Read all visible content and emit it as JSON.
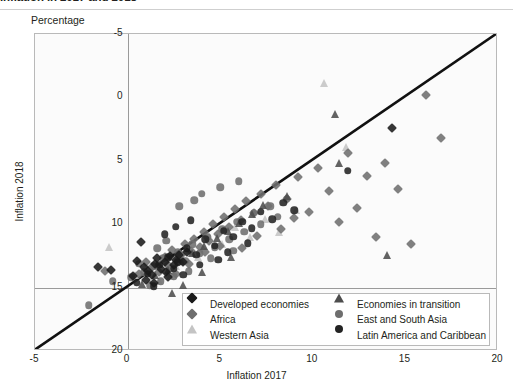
{
  "title": "Inflation in 2017 and 2018",
  "unit_label": "Percentage",
  "axes": {
    "xlabel": "Inflation 2017",
    "ylabel": "Inflation 2018",
    "xticks": [
      "-5",
      "0",
      "5",
      "10",
      "15",
      "20"
    ],
    "yticks": [
      "20",
      "15",
      "10",
      "5",
      "0",
      "-5"
    ]
  },
  "legend": {
    "column1": [
      {
        "label": "Developed economies",
        "marker": "diamond",
        "color": "#1a1a1a"
      },
      {
        "label": "Africa",
        "marker": "diamond",
        "color": "#6e6e6e"
      },
      {
        "label": "Western Asia",
        "marker": "triangle",
        "color": "#c4c4c4"
      }
    ],
    "column2": [
      {
        "label": "Economies in transition",
        "marker": "triangle",
        "color": "#4d4d4d"
      },
      {
        "label": "East and South Asia",
        "marker": "circle",
        "color": "#6e6e6e"
      },
      {
        "label": "Latin America and Caribbean",
        "marker": "circle",
        "color": "#232323"
      }
    ]
  },
  "chart_data": {
    "type": "scatter",
    "title": "Inflation in 2017 and 2018",
    "xlabel": "Inflation 2017",
    "ylabel": "Inflation 2018",
    "unit": "Percentage",
    "xlim": [
      -5,
      20
    ],
    "ylim": [
      -5,
      20
    ],
    "xticks": [
      -5,
      0,
      5,
      10,
      15,
      20
    ],
    "yticks": [
      -5,
      0,
      5,
      10,
      15,
      20
    ],
    "grid": false,
    "legend_position": "bottom-center-inside",
    "reference_line": {
      "type": "identity",
      "from": [
        -5,
        -5
      ],
      "to": [
        20,
        20
      ],
      "color": "#111111",
      "width": 2.6
    },
    "series": [
      {
        "name": "Developed economies",
        "marker": "diamond",
        "color": "#1a1a1a",
        "size": 7,
        "points": [
          [
            -1.6,
            1.6
          ],
          [
            -0.9,
            1.4
          ],
          [
            0.7,
            3.6
          ],
          [
            0.5,
            2.1
          ],
          [
            0.9,
            1.6
          ],
          [
            1.1,
            1.3
          ],
          [
            1.3,
            1.0
          ],
          [
            1.5,
            1.9
          ],
          [
            1.6,
            2.3
          ],
          [
            1.8,
            1.5
          ],
          [
            2.0,
            2.0
          ],
          [
            2.1,
            1.2
          ],
          [
            2.3,
            2.5
          ],
          [
            2.5,
            1.8
          ],
          [
            2.6,
            2.2
          ],
          [
            2.8,
            2.6
          ],
          [
            3.0,
            2.0
          ],
          [
            3.2,
            2.8
          ],
          [
            1.0,
            0.6
          ],
          [
            1.4,
            0.4
          ],
          [
            0.3,
            0.9
          ],
          [
            2.2,
            0.8
          ],
          [
            14.3,
            12.6
          ]
        ]
      },
      {
        "name": "Africa",
        "marker": "diamond",
        "color": "#6e6e6e",
        "size": 7,
        "points": [
          [
            -1.2,
            1.3
          ],
          [
            0.6,
            1.1
          ],
          [
            1.0,
            2.0
          ],
          [
            1.3,
            1.6
          ],
          [
            1.7,
            1.2
          ],
          [
            2.0,
            2.4
          ],
          [
            2.2,
            1.8
          ],
          [
            2.4,
            3.0
          ],
          [
            2.7,
            2.2
          ],
          [
            2.9,
            2.6
          ],
          [
            3.1,
            3.4
          ],
          [
            3.4,
            2.9
          ],
          [
            3.6,
            3.8
          ],
          [
            3.9,
            3.2
          ],
          [
            4.1,
            4.4
          ],
          [
            4.4,
            3.7
          ],
          [
            4.6,
            5.0
          ],
          [
            4.9,
            4.2
          ],
          [
            5.2,
            5.6
          ],
          [
            5.5,
            4.8
          ],
          [
            5.8,
            6.2
          ],
          [
            6.1,
            5.3
          ],
          [
            6.4,
            6.8
          ],
          [
            6.8,
            5.9
          ],
          [
            7.2,
            7.4
          ],
          [
            7.6,
            6.4
          ],
          [
            8.0,
            8.1
          ],
          [
            8.6,
            7.0
          ],
          [
            9.2,
            8.7
          ],
          [
            9.8,
            6.0
          ],
          [
            10.3,
            9.4
          ],
          [
            10.9,
            7.6
          ],
          [
            11.4,
            5.2
          ],
          [
            11.9,
            10.6
          ],
          [
            12.4,
            6.3
          ],
          [
            12.9,
            8.8
          ],
          [
            13.4,
            4.0
          ],
          [
            13.9,
            9.8
          ],
          [
            14.6,
            7.8
          ],
          [
            15.3,
            3.4
          ],
          [
            16.1,
            15.2
          ],
          [
            16.9,
            11.8
          ],
          [
            6.2,
            3.1
          ],
          [
            7.0,
            4.1
          ],
          [
            8.3,
            4.6
          ],
          [
            9.0,
            5.5
          ],
          [
            4.2,
            2.8
          ],
          [
            3.3,
            1.9
          ],
          [
            2.6,
            1.1
          ],
          [
            5.0,
            3.3
          ]
        ]
      },
      {
        "name": "Western Asia",
        "marker": "triangle",
        "color": "#c4c4c4",
        "size": 8,
        "points": [
          [
            -1.0,
            3.2
          ],
          [
            0.4,
            1.0
          ],
          [
            1.2,
            1.5
          ],
          [
            2.0,
            2.2
          ],
          [
            2.6,
            1.7
          ],
          [
            3.2,
            3.0
          ],
          [
            3.8,
            2.4
          ],
          [
            4.4,
            4.1
          ],
          [
            5.1,
            3.4
          ],
          [
            5.8,
            4.8
          ],
          [
            6.6,
            4.0
          ],
          [
            7.4,
            5.4
          ],
          [
            8.2,
            4.4
          ],
          [
            9.1,
            6.1
          ],
          [
            10.6,
            16.1
          ],
          [
            11.8,
            11.1
          ],
          [
            2.3,
            0.9
          ],
          [
            1.7,
            0.5
          ]
        ]
      },
      {
        "name": "Economies in transition",
        "marker": "triangle",
        "color": "#4d4d4d",
        "size": 8,
        "points": [
          [
            0.8,
            0.3
          ],
          [
            1.5,
            1.0
          ],
          [
            2.2,
            1.4
          ],
          [
            2.9,
            2.1
          ],
          [
            3.5,
            2.7
          ],
          [
            4.1,
            3.3
          ],
          [
            4.8,
            3.9
          ],
          [
            5.4,
            4.5
          ],
          [
            6.0,
            5.1
          ],
          [
            6.7,
            5.8
          ],
          [
            7.3,
            6.5
          ],
          [
            2.4,
            -0.4
          ],
          [
            3.0,
            0.2
          ],
          [
            4.0,
            1.2
          ],
          [
            5.6,
            2.4
          ],
          [
            8.6,
            7.2
          ],
          [
            11.2,
            13.7
          ],
          [
            11.4,
            9.8
          ],
          [
            14.0,
            2.6
          ]
        ]
      },
      {
        "name": "East and South Asia",
        "marker": "circle",
        "color": "#6e6e6e",
        "size": 7.5,
        "points": [
          [
            -2.1,
            -1.4
          ],
          [
            -0.8,
            0.5
          ],
          [
            0.2,
            0.8
          ],
          [
            0.9,
            1.2
          ],
          [
            1.4,
            1.7
          ],
          [
            1.9,
            2.3
          ],
          [
            2.3,
            1.5
          ],
          [
            2.7,
            2.8
          ],
          [
            3.1,
            2.1
          ],
          [
            3.5,
            3.4
          ],
          [
            3.9,
            2.7
          ],
          [
            4.3,
            4.0
          ],
          [
            4.7,
            3.2
          ],
          [
            5.1,
            4.6
          ],
          [
            5.5,
            3.8
          ],
          [
            5.9,
            5.2
          ],
          [
            6.3,
            4.4
          ],
          [
            6.8,
            5.9
          ],
          [
            7.2,
            5.0
          ],
          [
            7.7,
            6.4
          ],
          [
            8.1,
            5.6
          ],
          [
            8.6,
            7.0
          ],
          [
            4.0,
            7.4
          ],
          [
            5.0,
            7.9
          ],
          [
            6.0,
            8.4
          ],
          [
            2.8,
            6.4
          ],
          [
            3.6,
            6.9
          ],
          [
            1.8,
            0.5
          ],
          [
            2.5,
            0.9
          ],
          [
            1.2,
            0.2
          ],
          [
            0.6,
            1.9
          ],
          [
            1.6,
            3.1
          ],
          [
            2.1,
            3.7
          ],
          [
            3.3,
            1.3
          ],
          [
            4.5,
            2.3
          ],
          [
            5.7,
            2.9
          ]
        ]
      },
      {
        "name": "Latin America and Caribbean",
        "marker": "circle",
        "color": "#232323",
        "size": 7.5,
        "points": [
          [
            0.5,
            0.4
          ],
          [
            1.1,
            1.1
          ],
          [
            1.7,
            1.8
          ],
          [
            2.2,
            2.4
          ],
          [
            2.7,
            2.0
          ],
          [
            3.2,
            3.1
          ],
          [
            3.7,
            2.6
          ],
          [
            4.2,
            3.8
          ],
          [
            4.7,
            3.3
          ],
          [
            5.2,
            4.5
          ],
          [
            5.7,
            4.0
          ],
          [
            6.2,
            5.2
          ],
          [
            6.7,
            4.7
          ],
          [
            7.2,
            6.0
          ],
          [
            7.8,
            5.4
          ],
          [
            8.4,
            6.7
          ],
          [
            9.0,
            6.1
          ],
          [
            11.9,
            9.2
          ],
          [
            1.4,
            0.1
          ],
          [
            2.5,
            1.5
          ],
          [
            3.0,
            1.0
          ],
          [
            3.9,
            1.8
          ],
          [
            4.9,
            2.2
          ],
          [
            5.4,
            2.8
          ],
          [
            6.5,
            3.5
          ],
          [
            2.0,
            4.2
          ],
          [
            2.6,
            4.8
          ],
          [
            3.4,
            5.3
          ]
        ]
      }
    ]
  }
}
